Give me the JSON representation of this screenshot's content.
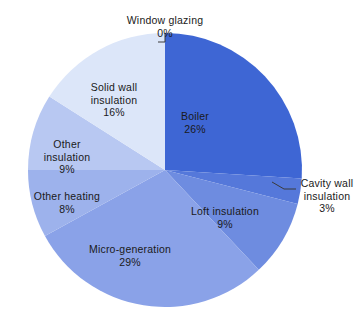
{
  "chart_data": {
    "type": "pie",
    "title": "",
    "subtitle": "",
    "xlabel": "",
    "ylabel": "",
    "legend_position": "none",
    "grid": false,
    "value_unit": "%",
    "start_angle_deg": 0,
    "direction": "clockwise",
    "categories": [
      "Window glazing",
      "Boiler",
      "Cavity wall insulation",
      "Loft insulation",
      "Micro-generation",
      "Other heating",
      "Other insulation",
      "Solid wall insulation"
    ],
    "values": [
      0,
      26,
      3,
      9,
      29,
      8,
      9,
      16
    ],
    "slices": [
      {
        "label": "Window glazing",
        "value": 0,
        "pct_text": "0%",
        "color": "#2f57c9",
        "label_style": "callout"
      },
      {
        "label": "Boiler",
        "value": 26,
        "pct_text": "26%",
        "color": "#3e66d4",
        "label_style": "inside"
      },
      {
        "label": "Cavity wall insulation",
        "value": 3,
        "pct_text": "3%",
        "color": "#5578da",
        "label_style": "callout"
      },
      {
        "label": "Loft insulation",
        "value": 9,
        "pct_text": "9%",
        "color": "#6e8ce0",
        "label_style": "inside"
      },
      {
        "label": "Micro-generation",
        "value": 29,
        "pct_text": "29%",
        "color": "#8aa2e8",
        "label_style": "inside"
      },
      {
        "label": "Other heating",
        "value": 8,
        "pct_text": "8%",
        "color": "#9db2ec",
        "label_style": "inside"
      },
      {
        "label": "Other insulation",
        "value": 9,
        "pct_text": "9%",
        "color": "#b8c8f2",
        "label_style": "inside"
      },
      {
        "label": "Solid wall insulation",
        "value": 16,
        "pct_text": "16%",
        "color": "#dce6f9",
        "label_style": "inside"
      }
    ]
  },
  "labels": {
    "window_glazing": {
      "name": "Window glazing",
      "pct": "0%"
    },
    "boiler": {
      "name": "Boiler",
      "pct": "26%"
    },
    "cavity_line1": {
      "name": "Cavity wall",
      "pct": "3%"
    },
    "cavity_line2": {
      "name": "insulation"
    },
    "loft": {
      "name": "Loft insulation",
      "pct": "9%"
    },
    "micro": {
      "name": "Micro-generation",
      "pct": "29%"
    },
    "other_heating": {
      "name": "Other heating",
      "pct": "8%"
    },
    "other_insulation": {
      "name": "Other",
      "pct": "9%"
    },
    "other_ins_line2": {
      "name": "insulation"
    },
    "solid_wall": {
      "name": "Solid wall",
      "pct": "16%"
    },
    "solid_wall_line2": {
      "name": "insulation"
    }
  },
  "colors": {
    "background": "#ffffff",
    "text": "#1a1a1a",
    "leader_line": "#3a3a3a"
  }
}
